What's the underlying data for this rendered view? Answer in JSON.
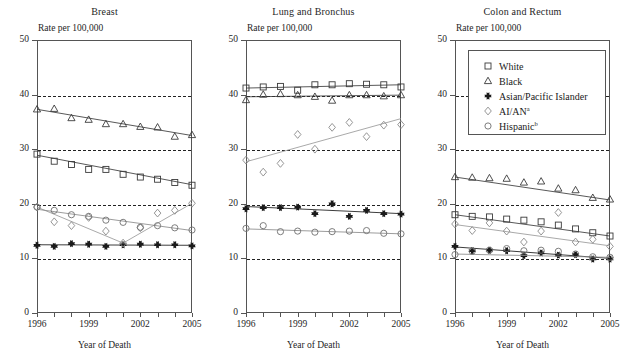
{
  "figure": {
    "x_axis_title": "Year of Death",
    "y_axis_title": "Rate per 100,000"
  },
  "legend": {
    "entries": [
      {
        "label": "White",
        "marker": "square-marker",
        "sup": ""
      },
      {
        "label": "Black",
        "marker": "triangle-marker",
        "sup": ""
      },
      {
        "label": "Asian/Pacific Islander",
        "marker": "cross-marker",
        "sup": ""
      },
      {
        "label": "AI/AN",
        "marker": "diamond-marker",
        "sup": "a"
      },
      {
        "label": "Hispanic",
        "marker": "circle-marker",
        "sup": "b"
      }
    ]
  },
  "chart_data": [
    {
      "type": "scatter",
      "title": "Breast",
      "xlabel": "Year of Death",
      "ylabel": "Rate per 100,000",
      "xlim": [
        1996,
        2005
      ],
      "ylim": [
        0,
        50
      ],
      "yticks": [
        0,
        10,
        20,
        30,
        40,
        50
      ],
      "xticks": [
        1996,
        1997,
        1998,
        1999,
        2000,
        2001,
        2002,
        2003,
        2004,
        2005
      ],
      "xticklabels": [
        "1996",
        "",
        "",
        "1999",
        "",
        "",
        "2002",
        "",
        "",
        "2005"
      ],
      "gridlines": [
        10,
        20,
        30,
        40
      ],
      "grid": true,
      "legend_position": "none",
      "x": [
        1996,
        1997,
        1998,
        1999,
        2000,
        2001,
        2002,
        2003,
        2004,
        2005
      ],
      "series": [
        {
          "name": "White",
          "marker": "square",
          "values": [
            29.1,
            27.8,
            27.2,
            26.3,
            26.3,
            25.4,
            24.9,
            24.5,
            23.9,
            23.4
          ],
          "trend": [
            28.9,
            23.5
          ]
        },
        {
          "name": "Black",
          "marker": "triangle",
          "values": [
            37.3,
            37.4,
            35.7,
            35.4,
            34.6,
            34.6,
            34.1,
            34.0,
            32.3,
            32.6
          ],
          "trend": [
            37.3,
            32.5
          ]
        },
        {
          "name": "Asian/Pacific Islander",
          "marker": "cross",
          "values": [
            12.4,
            12.2,
            12.7,
            12.6,
            12.2,
            12.5,
            12.6,
            12.5,
            12.5,
            12.3
          ],
          "trend": [
            12.5,
            12.4
          ]
        },
        {
          "name": "AI/AN",
          "marker": "diamond",
          "values": [
            19.4,
            16.7,
            16.0,
            17.5,
            15.0,
            12.8,
            15.6,
            18.3,
            18.8,
            20.1
          ],
          "trend_segments": [
            [
              19.4,
              12.8
            ],
            [
              12.8,
              20.1
            ]
          ]
        },
        {
          "name": "Hispanic",
          "marker": "circle",
          "values": [
            19.4,
            18.8,
            18.0,
            17.7,
            17.0,
            16.6,
            15.7,
            16.0,
            15.6,
            15.2
          ],
          "trend": [
            19.0,
            15.1
          ]
        }
      ]
    },
    {
      "type": "scatter",
      "title": "Lung and Bronchus",
      "xlabel": "Year of Death",
      "ylabel": "Rate per 100,000",
      "xlim": [
        1996,
        2005
      ],
      "ylim": [
        0,
        50
      ],
      "yticks": [
        0,
        10,
        20,
        30,
        40,
        50
      ],
      "xticks": [
        1996,
        1997,
        1998,
        1999,
        2000,
        2001,
        2002,
        2003,
        2004,
        2005
      ],
      "xticklabels": [
        "1996",
        "",
        "",
        "1999",
        "",
        "",
        "2002",
        "",
        "",
        "2005"
      ],
      "gridlines": [
        10,
        20,
        30,
        40
      ],
      "grid": true,
      "legend_position": "none",
      "x": [
        1996,
        1997,
        1998,
        1999,
        2000,
        2001,
        2002,
        2003,
        2004,
        2005
      ],
      "series": [
        {
          "name": "White",
          "marker": "square",
          "values": [
            41.2,
            41.4,
            41.5,
            40.8,
            41.8,
            41.8,
            42.0,
            41.9,
            41.8,
            41.4
          ],
          "trend": [
            41.2,
            41.8
          ]
        },
        {
          "name": "Black",
          "marker": "triangle",
          "values": [
            39.0,
            40.0,
            40.1,
            39.9,
            39.6,
            38.9,
            39.9,
            39.9,
            39.7,
            39.9
          ],
          "trend": [
            39.6,
            39.9
          ]
        },
        {
          "name": "Asian/Pacific Islander",
          "marker": "cross",
          "values": [
            19.1,
            19.3,
            19.3,
            19.4,
            18.2,
            20.0,
            17.7,
            18.8,
            18.2,
            18.1
          ],
          "trend": [
            19.5,
            18.2
          ]
        },
        {
          "name": "AI/AN",
          "marker": "diamond",
          "values": [
            28.0,
            25.8,
            27.4,
            32.7,
            30.0,
            34.0,
            34.9,
            32.3,
            34.4,
            34.5
          ],
          "trend": [
            27.7,
            35.6
          ]
        },
        {
          "name": "Hispanic",
          "marker": "circle",
          "values": [
            15.5,
            16.0,
            14.9,
            15.0,
            14.8,
            14.9,
            15.0,
            15.1,
            14.6,
            14.5
          ],
          "trend": [
            15.4,
            14.5
          ]
        }
      ]
    },
    {
      "type": "scatter",
      "title": "Colon and Rectum",
      "xlabel": "Year of Death",
      "ylabel": "Rate per 100,000",
      "xlim": [
        1996,
        2005
      ],
      "ylim": [
        0,
        50
      ],
      "yticks": [
        0,
        10,
        20,
        30,
        40,
        50
      ],
      "xticks": [
        1996,
        1997,
        1998,
        1999,
        2000,
        2001,
        2002,
        2003,
        2004,
        2005
      ],
      "xticklabels": [
        "1996",
        "",
        "",
        "1999",
        "",
        "",
        "2002",
        "",
        "",
        "2005"
      ],
      "gridlines": [
        10,
        20,
        30,
        40
      ],
      "grid": true,
      "legend_position": "upper-right",
      "x": [
        1996,
        1997,
        1998,
        1999,
        2000,
        2001,
        2002,
        2003,
        2004,
        2005
      ],
      "series": [
        {
          "name": "White",
          "marker": "square",
          "values": [
            18.0,
            17.7,
            17.6,
            17.2,
            17.0,
            16.7,
            16.1,
            15.4,
            14.7,
            14.1
          ],
          "trend": [
            18.0,
            14.1
          ]
        },
        {
          "name": "Black",
          "marker": "triangle",
          "values": [
            24.9,
            24.8,
            24.7,
            24.6,
            23.9,
            24.1,
            22.8,
            22.5,
            21.1,
            20.8
          ],
          "trend": [
            24.9,
            20.7
          ]
        },
        {
          "name": "Asian/Pacific Islander",
          "marker": "cross",
          "values": [
            12.2,
            11.4,
            11.5,
            11.4,
            10.5,
            11.0,
            10.6,
            10.7,
            9.9,
            9.9
          ],
          "trend": [
            12.1,
            10.0
          ]
        },
        {
          "name": "AI/AN",
          "marker": "diamond",
          "values": [
            16.3,
            15.1,
            16.5,
            15.0,
            13.0,
            15.0,
            18.4,
            13.0,
            13.5,
            12.2
          ],
          "trend": [
            16.2,
            12.3
          ]
        },
        {
          "name": "Hispanic",
          "marker": "circle",
          "values": [
            10.7,
            11.3,
            11.5,
            11.8,
            11.4,
            11.5,
            11.3,
            10.8,
            10.3,
            10.2
          ],
          "trend": [
            10.8,
            10.2
          ]
        }
      ]
    }
  ]
}
